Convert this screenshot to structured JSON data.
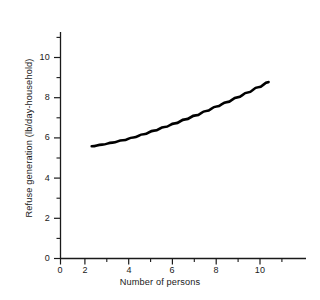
{
  "chart_data": {
    "type": "line",
    "title": "",
    "subtitle": "",
    "xlabel": "Number of persons",
    "ylabel": "Refuse generation (lb/day-household)",
    "xlim": [
      0,
      11.8
    ],
    "ylim": [
      0,
      11.3
    ],
    "grid": false,
    "legend": "none",
    "x_ticks_major": [
      0,
      2,
      4,
      6,
      8,
      10
    ],
    "x_tick_labels": [
      "0",
      "2",
      "4",
      "6",
      "8",
      "10"
    ],
    "x_ticks_minor": [
      1,
      3,
      5,
      7,
      9,
      11
    ],
    "y_ticks_major": [
      0,
      2,
      4,
      6,
      8,
      10
    ],
    "y_tick_labels": [
      "0",
      "2",
      "4",
      "6",
      "8",
      "10"
    ],
    "y_ticks_minor": [
      1,
      3,
      5,
      7,
      9,
      11
    ],
    "line_color": "#000000",
    "axis_color": "#1a1a1a",
    "background_color": "#ffffff",
    "series": [
      {
        "name": "Refuse generation",
        "x": [
          1.5,
          2.0,
          2.5,
          3.0,
          3.5,
          4.0,
          4.5,
          5.0,
          5.5,
          6.0,
          6.5,
          7.0,
          7.5,
          8.0,
          8.5,
          9.0,
          9.5,
          10.0
        ],
        "values": [
          5.6,
          5.68,
          5.78,
          5.9,
          6.04,
          6.2,
          6.38,
          6.56,
          6.74,
          6.94,
          7.14,
          7.36,
          7.58,
          7.8,
          8.04,
          8.28,
          8.54,
          8.8
        ]
      }
    ]
  },
  "axes": {
    "y_title": "Refuse generation (lb/day-household)",
    "x_title": "Number of persons",
    "y_labels": [
      {
        "text": "10",
        "value": 10
      },
      {
        "text": "8",
        "value": 8
      },
      {
        "text": "6",
        "value": 6
      },
      {
        "text": "4",
        "value": 4
      },
      {
        "text": "2",
        "value": 2
      },
      {
        "text": "0",
        "value": 0
      }
    ],
    "x_labels": [
      {
        "text": "0",
        "value": 0
      },
      {
        "text": "2",
        "value": 2
      },
      {
        "text": "4",
        "value": 4
      },
      {
        "text": "6",
        "value": 6
      },
      {
        "text": "8",
        "value": 8
      },
      {
        "text": "10",
        "value": 10
      }
    ]
  }
}
